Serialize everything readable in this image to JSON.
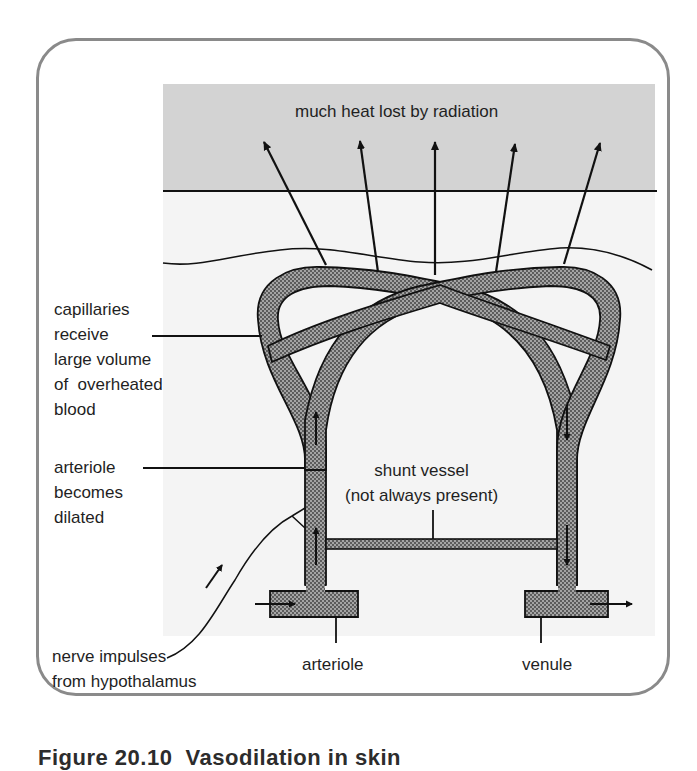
{
  "figure": {
    "caption": "Figure 20.10  Vasodilation in skin",
    "colors": {
      "frame_border": "#8a8a8a",
      "air_band": "#d2d2d2",
      "skin_tissue": "#f4f4f4",
      "vessel_fill": "#9a9a9a",
      "ink": "#111111"
    },
    "labels": {
      "heat": "much heat lost by radiation",
      "capillaries": "capillaries\nreceive\nlarge volume\nof  overheated\nblood",
      "arteriole_dilated": "arteriole\nbecomes\ndilated",
      "shunt": "shunt vessel\n(not always present)",
      "nerve": "nerve impulses\nfrom hypothalamus",
      "arteriole": "arteriole",
      "venule": "venule"
    }
  }
}
